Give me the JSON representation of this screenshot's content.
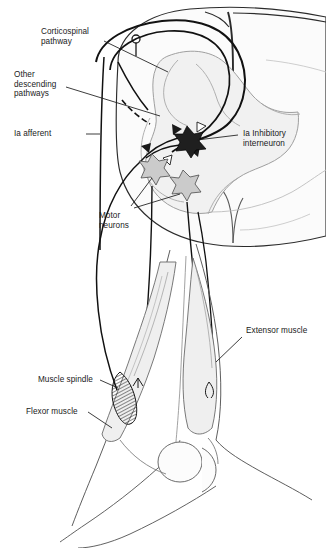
{
  "figure": {
    "type": "anatomical-diagram",
    "background_color": "#ffffff",
    "line_color": "#1a1a1a",
    "gray_matter_fill": "#f2f2f2",
    "white_matter_fill": "#fafafa",
    "muscle_fill": "#eeeeee",
    "interneuron_fill": "#1f1f1f",
    "motor_neuron_fill": "#cccccc"
  },
  "labels": {
    "corticospinal_pathway": "Corticospinal\npathway",
    "other_descending_pathways": "Other\ndescending\npathways",
    "ia_afferent": "Ia afferent",
    "ia_inhibitory_interneuron": "Ia Inhibitory\ninterneuron",
    "motor_neurons": "Motor\nneurons",
    "extensor_muscle": "Extensor muscle",
    "muscle_spindle": "Muscle spindle",
    "flexor_muscle": "Flexor muscle"
  },
  "structures": {
    "spinal_cord": "spinal-cord-cross-section",
    "dorsal_median_sulcus": "dorsal-median-sulcus",
    "ventral_median_fissure": "ventral-median-fissure",
    "gray_matter_butterfly": "gray-matter",
    "stimulating_electrode": "stimulating-electrode",
    "limb": "hind-limb-outline",
    "knee_joint": "knee-joint-bones"
  },
  "neurons": [
    {
      "name": "ia-inhibitory-interneuron",
      "shade": "dark",
      "cx": 187,
      "cy": 139
    },
    {
      "name": "motor-neuron-flexor",
      "shade": "light",
      "cx": 152,
      "cy": 167
    },
    {
      "name": "motor-neuron-extensor",
      "shade": "light",
      "cx": 183,
      "cy": 183
    }
  ],
  "synapses": [
    {
      "name": "excitatory-terminal",
      "type": "filled-triangle"
    },
    {
      "name": "inhibitory-terminal",
      "type": "open-triangle"
    }
  ]
}
